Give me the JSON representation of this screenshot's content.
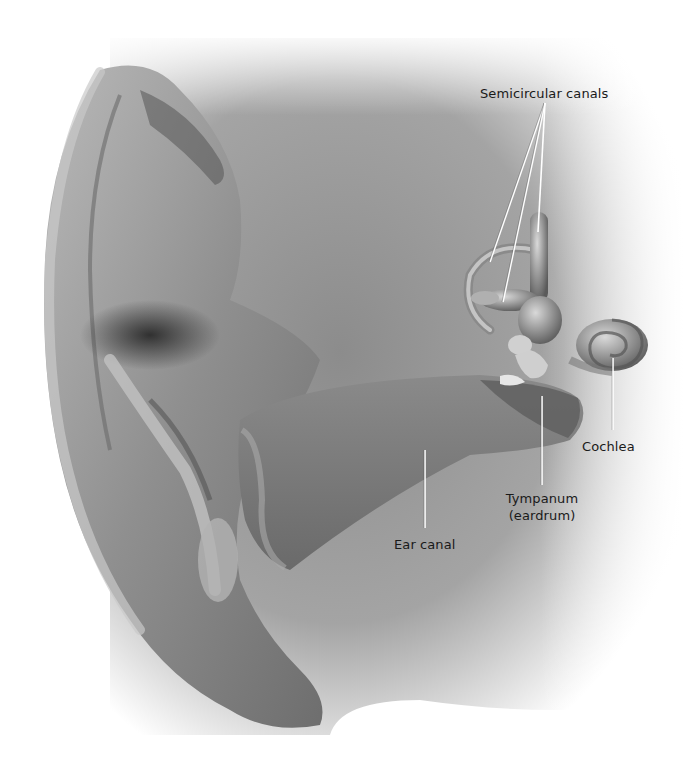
{
  "diagram": {
    "colors": {
      "background": "#ffffff",
      "tissue_light": "#c8c8c8",
      "tissue_mid": "#9a9a9a",
      "tissue_dark": "#3e3e3e",
      "label_text": "#1a1a1a",
      "leader_line": "#ffffff"
    },
    "labels": [
      {
        "id": "semicircular-canals",
        "text": "Semicircular canals",
        "x": 480,
        "y": 85
      },
      {
        "id": "cochlea",
        "text": "Cochlea",
        "x": 582,
        "y": 438
      },
      {
        "id": "tympanum",
        "text_line1": "Tympanum",
        "text_line2": "(eardrum)",
        "x": 502,
        "y": 497
      },
      {
        "id": "ear-canal",
        "text": "Ear canal",
        "x": 394,
        "y": 536
      }
    ],
    "leader_lines": [
      {
        "target": "semicircular-canals-1",
        "x1": 545,
        "y1": 103,
        "x2": 490,
        "y2": 262
      },
      {
        "target": "semicircular-canals-2",
        "x1": 545,
        "y1": 103,
        "x2": 503,
        "y2": 302
      },
      {
        "target": "semicircular-canals-3",
        "x1": 545,
        "y1": 103,
        "x2": 538,
        "y2": 232
      },
      {
        "target": "cochlea",
        "x1": 613,
        "y1": 358,
        "x2": 613,
        "y2": 430
      },
      {
        "target": "tympanum",
        "x1": 542,
        "y1": 396,
        "x2": 542,
        "y2": 485
      },
      {
        "target": "ear-canal",
        "x1": 425,
        "y1": 450,
        "x2": 425,
        "y2": 528
      }
    ]
  }
}
